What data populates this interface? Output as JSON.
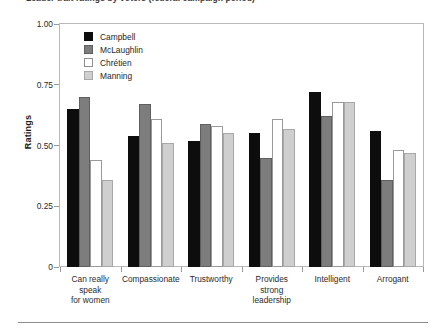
{
  "figure": {
    "title": "Leader trait ratings by voters (federal campaign period)",
    "footer_rule": true
  },
  "chart_data": {
    "type": "bar",
    "title": "Leader trait ratings by voters (federal campaign period)",
    "xlabel": "",
    "ylabel": "Ratings",
    "ylim": [
      0,
      1.0
    ],
    "yticks": [
      0,
      0.25,
      0.5,
      0.75,
      1.0
    ],
    "ytick_labels": [
      "0",
      "0.25",
      "0.50",
      "0.75",
      "1.00"
    ],
    "grid": false,
    "legend_position": "upper-left-inside",
    "categories": [
      "Can really speak for women",
      "Compassionate",
      "Trustworthy",
      "Provides strong leadership",
      "Intelligent",
      "Arrogant"
    ],
    "category_lines": [
      [
        "Can really",
        "speak",
        "for women"
      ],
      [
        "Compassionate"
      ],
      [
        "Trustworthy"
      ],
      [
        "Provides",
        "strong",
        "leadership"
      ],
      [
        "Intelligent"
      ],
      [
        "Arrogant"
      ]
    ],
    "series": [
      {
        "name": "Campbell",
        "color": "#0d0d0d",
        "values": [
          0.65,
          0.54,
          0.52,
          0.55,
          0.72,
          0.56
        ]
      },
      {
        "name": "McLaughlin",
        "color": "#7d7d7d",
        "values": [
          0.7,
          0.67,
          0.59,
          0.45,
          0.62,
          0.36
        ]
      },
      {
        "name": "Chrétien",
        "color": "#ffffff",
        "values": [
          0.44,
          0.61,
          0.58,
          0.61,
          0.68,
          0.48
        ]
      },
      {
        "name": "Manning",
        "color": "#cfcfcf",
        "values": [
          0.36,
          0.51,
          0.55,
          0.57,
          0.68,
          0.47
        ]
      }
    ]
  }
}
